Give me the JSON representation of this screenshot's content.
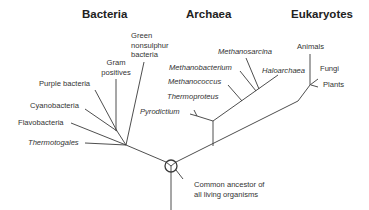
{
  "domains": {
    "bacteria": "Bacteria",
    "archaea": "Archaea",
    "eukaryotes": "Eukaryotes"
  },
  "bacteria": {
    "green_nonsulphur": [
      "Green",
      "nonsulphur",
      "bacteria"
    ],
    "gram_positives": [
      "Gram",
      "positives"
    ],
    "purple": "Purple bacteria",
    "cyanobacteria": "Cyanobacteria",
    "flavobacteria": "Flavobacteria",
    "thermotogales": "Thermotogales"
  },
  "archaea": {
    "methanosarcina": "Methanosarcina",
    "methanobacterium": "Methanobacterium",
    "haloarchaea": "Haloarchaea",
    "methanococcus": "Methanococcus",
    "thermoproteus": "Thermoproteus",
    "pyrodictium": "Pyrodictium"
  },
  "eukaryotes": {
    "animals": "Animals",
    "fungi": "Fungi",
    "plants": "Plants"
  },
  "root": {
    "label": [
      "Common ancestor of",
      "all living organisms"
    ]
  },
  "colors": {
    "line": "#3a3a3a",
    "text": "#333333"
  }
}
